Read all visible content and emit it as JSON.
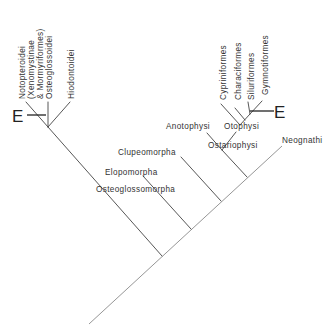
{
  "diagram": {
    "type": "cladogram",
    "taxa": {
      "notopteroidei": "Notopteroidei",
      "xenomystinae": "(Xenomystinae",
      "mormyriformes": "& Mormyriformes)",
      "osteoglossoidei": "Osteoglossoidei",
      "hiodontoidei": "Hiodontoidei",
      "osteoglossomorpha": "Osteoglossomorpha",
      "elopomorpha": "Elopomorpha",
      "clupeomorpha": "Clupeomorpha",
      "anotophysi": "Anotophysi",
      "otophysi": "Otophysi",
      "ostariophysi": "Ostariophysi",
      "neognathi": "Neognathi",
      "cypriniformes": "Cypriniformes",
      "characiformes": "Characiformes",
      "siluriformes": "Siluriformes",
      "gymnotiformes": "Gymnotiformes"
    },
    "markers": {
      "electro_left": "E",
      "electro_right": "E"
    },
    "colors": {
      "line": "#444444",
      "text": "#333333",
      "background": "#ffffff"
    }
  }
}
